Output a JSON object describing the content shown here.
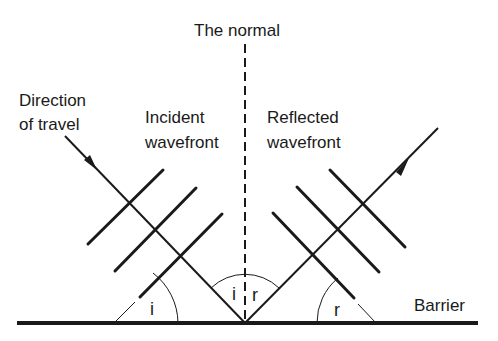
{
  "diagram": {
    "labels": {
      "normal": "The normal",
      "direction_line1": "Direction",
      "direction_line2": "of travel",
      "incident_line1": "Incident",
      "incident_line2": "wavefront",
      "reflected_line1": "Reflected",
      "reflected_line2": "wavefront",
      "barrier": "Barrier"
    },
    "angles": {
      "incidence_symbol": "i",
      "reflection_symbol": "r"
    },
    "colors": {
      "ink": "#1a1a1a",
      "background": "#ffffff"
    }
  }
}
